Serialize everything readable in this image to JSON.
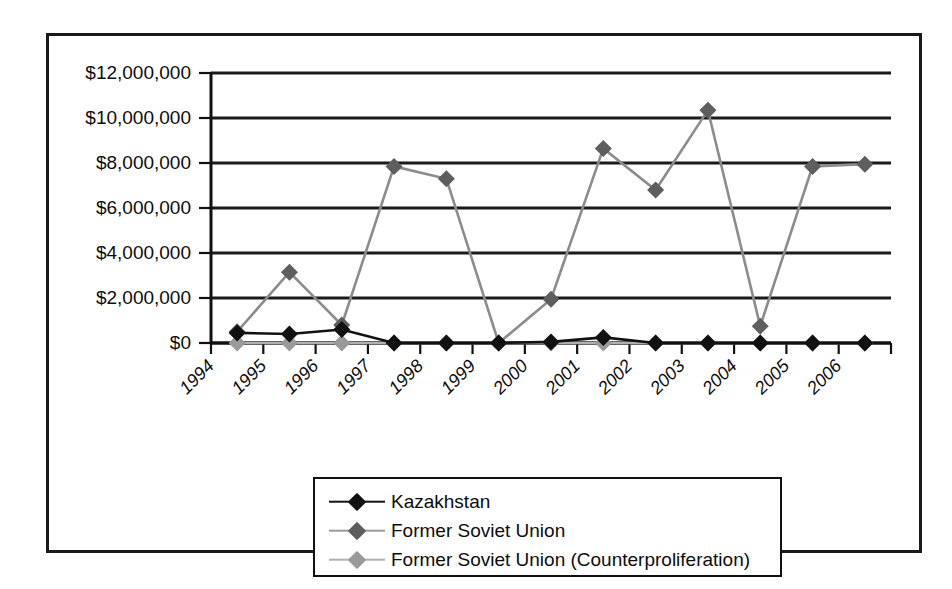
{
  "chart_data": {
    "type": "line",
    "title": "",
    "xlabel": "",
    "ylabel": "",
    "x": [
      1994,
      1995,
      1996,
      1997,
      1998,
      1999,
      2000,
      2001,
      2002,
      2003,
      2004,
      2005,
      2006
    ],
    "categories": [
      "1994",
      "1995",
      "1996",
      "1997",
      "1998",
      "1999",
      "2000",
      "2001",
      "2002",
      "2003",
      "2004",
      "2005",
      "2006"
    ],
    "xtick_labels": [
      "1994",
      "1995",
      "1996",
      "1997",
      "1998",
      "1999",
      "2000",
      "2001",
      "2002",
      "2003",
      "2004",
      "2005",
      "2006"
    ],
    "ytick_labels": [
      "$0",
      "$2,000,000",
      "$4,000,000",
      "$6,000,000",
      "$8,000,000",
      "$10,000,000",
      "$12,000,000"
    ],
    "ytick_values": [
      0,
      2000000,
      4000000,
      6000000,
      8000000,
      10000000,
      12000000
    ],
    "ylim": [
      0,
      12000000
    ],
    "grid": "horizontal",
    "legend_position": "bottom",
    "series": [
      {
        "name": "Kazakhstan",
        "color": "#111111",
        "marker": "diamond",
        "values": [
          450000,
          400000,
          600000,
          0,
          0,
          0,
          50000,
          250000,
          0,
          0,
          0,
          0,
          0
        ]
      },
      {
        "name": "Former Soviet Union",
        "color": "#5e5e5e",
        "marker": "diamond",
        "values": [
          500000,
          3150000,
          800000,
          7850000,
          7300000,
          0,
          1950000,
          8650000,
          6800000,
          10350000,
          750000,
          7850000,
          7950000
        ]
      },
      {
        "name": "Former Soviet Union (Counterproliferation)",
        "color": "#9a9a9a",
        "marker": "diamond",
        "values": [
          0,
          0,
          0,
          0,
          0,
          0,
          0,
          0,
          0,
          0,
          0,
          0,
          0
        ]
      }
    ]
  },
  "legend": {
    "items": [
      {
        "label": "Kazakhstan"
      },
      {
        "label": "Former Soviet Union"
      },
      {
        "label": "Former Soviet Union (Counterproliferation)"
      }
    ]
  },
  "colors": {
    "series_kazakhstan": "#111111",
    "series_fsu": "#5e5e5e",
    "series_fsu_counter": "#9a9a9a",
    "axis": "#111111",
    "background": "#ffffff"
  }
}
